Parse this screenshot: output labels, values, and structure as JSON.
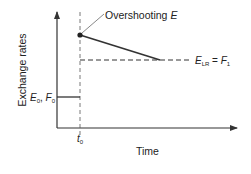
{
  "diagram": {
    "y_axis_label": "Exchange rates",
    "x_axis_label": "Time",
    "annotation": {
      "text": "Overshooting ",
      "italic": "E"
    },
    "long_run_label": {
      "e": "E",
      "e_sub": "LR",
      "eq": " = ",
      "f": "F",
      "f_sub": "1"
    },
    "initial_label": {
      "e": "E",
      "e_sub": "0",
      "sep": ", ",
      "f": "F",
      "f_sub": "0"
    },
    "time_marker": {
      "t": "t",
      "t_sub": "0"
    },
    "colors": {
      "line": "#333333",
      "axis": "#333333"
    }
  }
}
